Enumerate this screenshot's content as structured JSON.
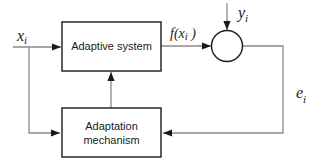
{
  "diagram": {
    "type": "block-diagram",
    "blocks": {
      "adaptive_system": {
        "label": "Adaptive system"
      },
      "adaptation_mechanism": {
        "label_line1": "Adaptation",
        "label_line2": "mechanism"
      }
    },
    "summing_node": {
      "label": ""
    },
    "signals": {
      "input": {
        "base": "x",
        "sub": "i"
      },
      "output": {
        "prefix": "f(",
        "base": "x",
        "sub": "i",
        "suffix": " )"
      },
      "desired": {
        "base": "y",
        "sub": "i"
      },
      "error": {
        "base": "e",
        "sub": "i"
      }
    },
    "connections": [
      {
        "from": "input",
        "to": "adaptive_system"
      },
      {
        "from": "input",
        "to": "adaptation_mechanism"
      },
      {
        "from": "adaptive_system",
        "to": "summing_node",
        "signal": "f(x_i)"
      },
      {
        "from": "desired",
        "to": "summing_node",
        "signal": "y_i"
      },
      {
        "from": "summing_node",
        "to": "adaptation_mechanism",
        "signal": "e_i"
      },
      {
        "from": "adaptation_mechanism",
        "to": "adaptive_system"
      }
    ],
    "colors": {
      "block_stroke": "#1a1a1a",
      "connector": "#8a8a8a",
      "text": "#1a1a1a"
    }
  }
}
